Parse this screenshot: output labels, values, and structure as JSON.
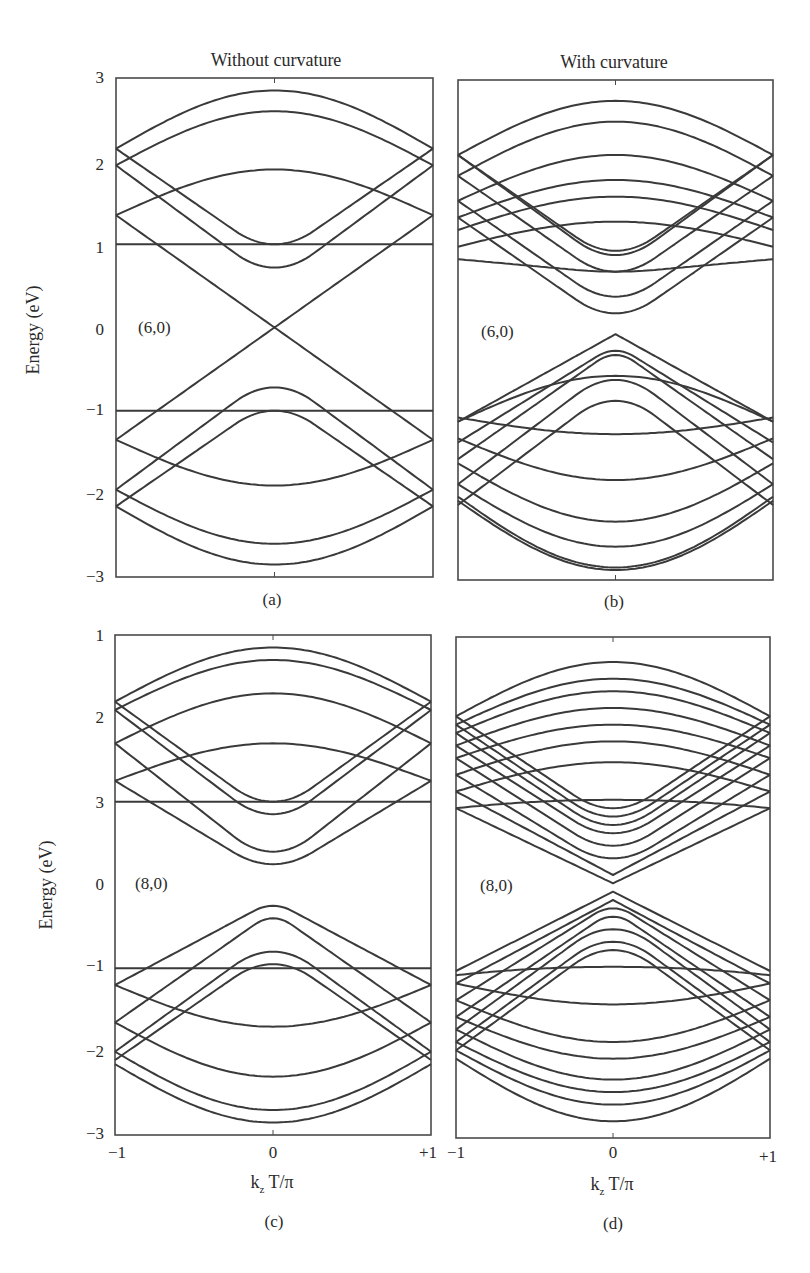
{
  "titles": {
    "left": "Without curvature",
    "right": "With curvature"
  },
  "y_axis_label": "Energy (eV)",
  "x_axis_label_main": "k",
  "x_axis_label_sub": "z",
  "x_axis_label_rest": " T/π",
  "x_ticks": [
    "−1",
    "0",
    "+1"
  ],
  "colors": {
    "line": "#3a3a3a",
    "frame": "#4a4a4a"
  },
  "chart_data": [
    {
      "type": "line",
      "panel": "(a)",
      "title": "Without curvature",
      "annotation": "(6,0)",
      "xlabel": "",
      "ylabel": "Energy (eV)",
      "xlim": [
        -1,
        1
      ],
      "ylim": [
        -3,
        3
      ],
      "yticks": [
        "3",
        "2",
        "1",
        "0",
        "−1",
        "−2",
        "−3"
      ],
      "bands": [
        {
          "center": 2.85,
          "edge": 2.15,
          "shape": "cos"
        },
        {
          "center": 2.6,
          "edge": 1.95,
          "shape": "cos"
        },
        {
          "center": 1.9,
          "edge": 1.35,
          "shape": "cos"
        },
        {
          "center": 1.0,
          "edge": 1.0,
          "shape": "flat"
        },
        {
          "center": 1.0,
          "edge": 2.15,
          "shape": "cosu"
        },
        {
          "center": 0.72,
          "edge": 1.95,
          "shape": "cosu"
        },
        {
          "center": 0.0,
          "edge": 1.35,
          "shape": "v"
        },
        {
          "center": 0.0,
          "edge": -1.35,
          "shape": "v"
        },
        {
          "center": -0.72,
          "edge": -1.95,
          "shape": "cosu"
        },
        {
          "center": -1.0,
          "edge": -2.15,
          "shape": "cosu"
        },
        {
          "center": -1.0,
          "edge": -1.0,
          "shape": "flat"
        },
        {
          "center": -1.9,
          "edge": -1.35,
          "shape": "cos"
        },
        {
          "center": -2.6,
          "edge": -1.95,
          "shape": "cos"
        },
        {
          "center": -2.85,
          "edge": -2.15,
          "shape": "cos"
        }
      ]
    },
    {
      "type": "line",
      "panel": "(b)",
      "title": "With curvature",
      "annotation": "(6,0)",
      "xlabel": "",
      "ylabel": "",
      "xlim": [
        -1,
        1
      ],
      "ylim": [
        -3,
        3
      ],
      "yticks": [],
      "bands": [
        {
          "center": 2.75,
          "edge": 2.1,
          "shape": "cos"
        },
        {
          "center": 2.5,
          "edge": 1.85,
          "shape": "cos"
        },
        {
          "center": 2.1,
          "edge": 1.55,
          "shape": "cos"
        },
        {
          "center": 1.8,
          "edge": 1.35,
          "shape": "cos"
        },
        {
          "center": 1.6,
          "edge": 1.2,
          "shape": "cos"
        },
        {
          "center": 1.3,
          "edge": 1.0,
          "shape": "cos"
        },
        {
          "center": 0.9,
          "edge": 2.1,
          "shape": "cosu"
        },
        {
          "center": 0.95,
          "edge": 2.1,
          "shape": "cosu"
        },
        {
          "center": 0.7,
          "edge": 0.85,
          "shape": "cosu"
        },
        {
          "center": 0.7,
          "edge": 1.85,
          "shape": "cosu"
        },
        {
          "center": 0.4,
          "edge": 1.55,
          "shape": "cosu"
        },
        {
          "center": 0.2,
          "edge": 1.35,
          "shape": "cosu"
        },
        {
          "center": -0.05,
          "edge": -1.1,
          "shape": "v"
        },
        {
          "center": -0.25,
          "edge": -1.35,
          "shape": "cosv"
        },
        {
          "center": -0.3,
          "edge": -1.55,
          "shape": "cosv"
        },
        {
          "center": -0.55,
          "edge": -1.1,
          "shape": "cos"
        },
        {
          "center": -0.6,
          "edge": -1.85,
          "shape": "cosu"
        },
        {
          "center": -0.85,
          "edge": -2.1,
          "shape": "cosu"
        },
        {
          "center": -1.25,
          "edge": -1.05,
          "shape": "cos"
        },
        {
          "center": -1.8,
          "edge": -1.3,
          "shape": "cos"
        },
        {
          "center": -2.3,
          "edge": -1.6,
          "shape": "cos"
        },
        {
          "center": -2.6,
          "edge": -1.85,
          "shape": "cos"
        },
        {
          "center": -2.85,
          "edge": -2.0,
          "shape": "cos"
        },
        {
          "center": -2.88,
          "edge": -2.05,
          "shape": "cos"
        }
      ]
    },
    {
      "type": "line",
      "panel": "(c)",
      "title": "",
      "annotation": "(8,0)",
      "xlabel": "k_z T/π",
      "ylabel": "Energy (eV)",
      "xlim": [
        -1,
        1
      ],
      "ylim": [
        -3,
        3
      ],
      "yticks": [
        "1",
        "2",
        "3",
        "0",
        "−1",
        "−2",
        "−3"
      ],
      "xticks": [
        "−1",
        "0",
        "+1"
      ],
      "bands": [
        {
          "center": 2.85,
          "edge": 2.2,
          "shape": "cos"
        },
        {
          "center": 2.7,
          "edge": 2.1,
          "shape": "cos"
        },
        {
          "center": 2.3,
          "edge": 1.7,
          "shape": "cos"
        },
        {
          "center": 1.7,
          "edge": 1.25,
          "shape": "cos"
        },
        {
          "center": 1.0,
          "edge": 1.0,
          "shape": "flat"
        },
        {
          "center": 1.0,
          "edge": 2.2,
          "shape": "cosu"
        },
        {
          "center": 0.85,
          "edge": 2.1,
          "shape": "cosu"
        },
        {
          "center": 0.4,
          "edge": 1.7,
          "shape": "cosu"
        },
        {
          "center": 0.25,
          "edge": 1.25,
          "shape": "cosu"
        },
        {
          "center": -0.25,
          "edge": -1.2,
          "shape": "cosv"
        },
        {
          "center": -0.4,
          "edge": -1.65,
          "shape": "cosv"
        },
        {
          "center": -0.8,
          "edge": -2.0,
          "shape": "cosu"
        },
        {
          "center": -0.95,
          "edge": -2.1,
          "shape": "cosu"
        },
        {
          "center": -1.0,
          "edge": -1.0,
          "shape": "flat"
        },
        {
          "center": -1.7,
          "edge": -1.2,
          "shape": "cos"
        },
        {
          "center": -2.3,
          "edge": -1.65,
          "shape": "cos"
        },
        {
          "center": -2.7,
          "edge": -2.0,
          "shape": "cos"
        },
        {
          "center": -2.85,
          "edge": -2.15,
          "shape": "cos"
        }
      ]
    },
    {
      "type": "line",
      "panel": "(d)",
      "title": "",
      "annotation": "(8,0)",
      "xlabel": "k_z T/π",
      "ylabel": "",
      "xlim": [
        -1,
        1
      ],
      "ylim": [
        -3,
        3
      ],
      "yticks": [],
      "xticks": [
        "−1",
        "0",
        "+1"
      ],
      "bands": [
        {
          "center": 2.7,
          "edge": 2.05,
          "shape": "cos"
        },
        {
          "center": 2.5,
          "edge": 1.95,
          "shape": "cos"
        },
        {
          "center": 2.35,
          "edge": 1.85,
          "shape": "cos"
        },
        {
          "center": 2.15,
          "edge": 1.7,
          "shape": "cos"
        },
        {
          "center": 1.95,
          "edge": 1.55,
          "shape": "cos"
        },
        {
          "center": 1.75,
          "edge": 1.35,
          "shape": "cos"
        },
        {
          "center": 1.5,
          "edge": 1.15,
          "shape": "cos"
        },
        {
          "center": 1.05,
          "edge": 0.95,
          "shape": "flat2"
        },
        {
          "center": 0.95,
          "edge": 2.05,
          "shape": "cosu"
        },
        {
          "center": 0.85,
          "edge": 1.95,
          "shape": "cosu"
        },
        {
          "center": 0.75,
          "edge": 1.85,
          "shape": "cosu"
        },
        {
          "center": 0.65,
          "edge": 1.7,
          "shape": "cosu"
        },
        {
          "center": 0.5,
          "edge": 1.55,
          "shape": "cosu"
        },
        {
          "center": 0.35,
          "edge": 1.35,
          "shape": "cosu"
        },
        {
          "center": 0.15,
          "edge": 1.15,
          "shape": "v"
        },
        {
          "center": 0.05,
          "edge": 0.95,
          "shape": "v"
        },
        {
          "center": -0.05,
          "edge": -1.0,
          "shape": "v"
        },
        {
          "center": -0.15,
          "edge": -1.15,
          "shape": "v"
        },
        {
          "center": -0.25,
          "edge": -1.35,
          "shape": "cosv"
        },
        {
          "center": -0.35,
          "edge": -1.55,
          "shape": "cosv"
        },
        {
          "center": -0.5,
          "edge": -1.7,
          "shape": "cosu"
        },
        {
          "center": -0.65,
          "edge": -1.85,
          "shape": "cosu"
        },
        {
          "center": -0.75,
          "edge": -1.95,
          "shape": "cosu"
        },
        {
          "center": -0.95,
          "edge": -1.05,
          "shape": "flat2"
        },
        {
          "center": -1.4,
          "edge": -1.15,
          "shape": "cos"
        },
        {
          "center": -1.85,
          "edge": -1.35,
          "shape": "cos"
        },
        {
          "center": -2.05,
          "edge": -1.55,
          "shape": "cos"
        },
        {
          "center": -2.3,
          "edge": -1.7,
          "shape": "cos"
        },
        {
          "center": -2.45,
          "edge": -1.85,
          "shape": "cos"
        },
        {
          "center": -2.6,
          "edge": -1.95,
          "shape": "cos"
        },
        {
          "center": -2.8,
          "edge": -2.05,
          "shape": "cos"
        }
      ]
    }
  ],
  "panels_layout": [
    {
      "x0": 116,
      "x1": 433,
      "y0": 78,
      "y1": 577
    },
    {
      "x0": 458,
      "x1": 773,
      "y0": 80,
      "y1": 580
    },
    {
      "x0": 115,
      "x1": 431,
      "y0": 635,
      "y1": 1135
    },
    {
      "x0": 456,
      "x1": 770,
      "y0": 637,
      "y1": 1138
    }
  ]
}
